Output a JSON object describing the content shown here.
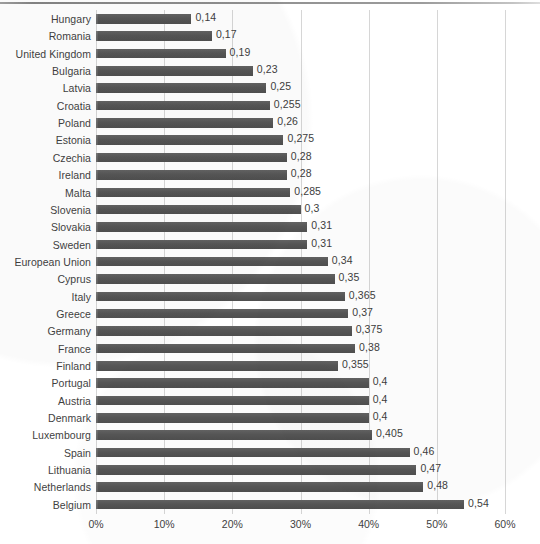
{
  "chart_data": {
    "type": "bar",
    "orientation": "horizontal",
    "title": "",
    "subtitle": "",
    "xlabel": "",
    "ylabel": "",
    "xlim": [
      0,
      0.6
    ],
    "grid": true,
    "legend": false,
    "legend_position": "none",
    "bar_color": "#595959",
    "gridline_color": "#d6d6d6",
    "value_label_format": "comma-decimal",
    "x_tick_labels": [
      "0%",
      "10%",
      "20%",
      "30%",
      "40%",
      "50%",
      "60%"
    ],
    "x_tick_values": [
      0,
      0.1,
      0.2,
      0.3,
      0.4,
      0.5,
      0.6
    ],
    "categories": [
      "Hungary",
      "Romania",
      "United Kingdom",
      "Bulgaria",
      "Latvia",
      "Croatia",
      "Poland",
      "Estonia",
      "Czechia",
      "Ireland",
      "Malta",
      "Slovenia",
      "Slovakia",
      "Sweden",
      "European Union",
      "Cyprus",
      "Italy",
      "Greece",
      "Germany",
      "France",
      "Finland",
      "Portugal",
      "Austria",
      "Denmark",
      "Luxembourg",
      "Spain",
      "Lithuania",
      "Netherlands",
      "Belgium"
    ],
    "values": [
      0.14,
      0.17,
      0.19,
      0.23,
      0.25,
      0.255,
      0.26,
      0.275,
      0.28,
      0.28,
      0.285,
      0.3,
      0.31,
      0.31,
      0.34,
      0.35,
      0.365,
      0.37,
      0.375,
      0.38,
      0.355,
      0.4,
      0.4,
      0.4,
      0.405,
      0.46,
      0.47,
      0.48,
      0.54
    ],
    "value_labels": [
      "0,14",
      "0,17",
      "0,19",
      "0,23",
      "0,25",
      "0,255",
      "0,26",
      "0,275",
      "0,28",
      "0,28",
      "0,285",
      "0,3",
      "0,31",
      "0,31",
      "0,34",
      "0,35",
      "0,365",
      "0,37",
      "0,375",
      "0,38",
      "0,355",
      "0,4",
      "0,4",
      "0,4",
      "0,405",
      "0,46",
      "0,47",
      "0,48",
      "0,54"
    ]
  }
}
